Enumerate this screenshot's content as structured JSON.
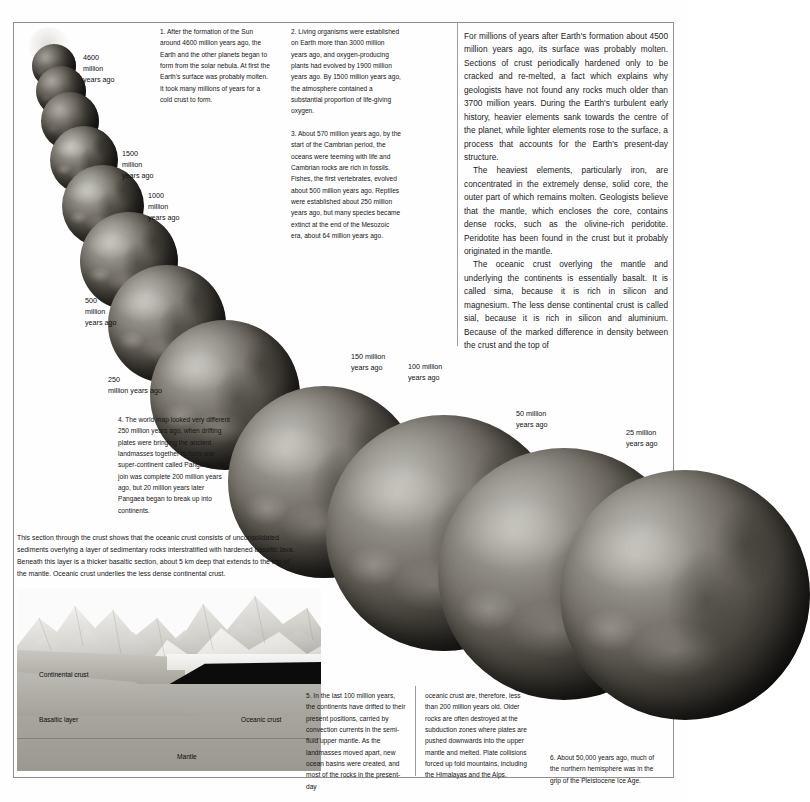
{
  "document": {
    "title": "The formation and structure of the Earth",
    "page_width": 687,
    "page_height": 802
  },
  "article": {
    "paragraphs": [
      "For millions of years after Earth's formation about 4500 million years ago, its surface was probably molten. Sections of crust periodically hardened only to be cracked and re-melted, a fact which explains why geologists have not found any rocks much older than 3700 million years. During the Earth's turbulent early history, heavier elements sank towards the centre of the planet, while lighter elements rose to the surface, a process that accounts for the Earth's present-day structure.",
      "The heaviest elements, particularly iron, are concentrated in the extremely dense, solid core, the outer part of which remains molten. Geologists believe that the mantle, which encloses the core, contains dense rocks, such as the olivine-rich peridotite. Peridotite has been found in the crust but it probably originated in the mantle.",
      "The oceanic crust overlying the mantle and underlying the continents is essentially basalt. It is called sima, because it is rich in silicon and magnesium. The less dense continental crust is called sial, because it is rich in silicon and aluminium. Because of the marked difference in density between the crust and the top of"
    ],
    "italic_terms": [
      "sima",
      "sial"
    ]
  },
  "notes": [
    {
      "number": "1.",
      "text": "After the formation of the Sun around 4600 million years ago, the Earth and the other planets began to form from the solar nebula. At first the Earth's surface was probably molten. It took many millions of years for a cold crust to form."
    },
    {
      "number": "2.",
      "text": "Living organisms were established on Earth more than 3000 million years ago, and oxygen-producing plants had evolved by 1900 million years ago. By 1500 million years ago, the atmosphere contained a substantial proportion of life-giving oxygen."
    },
    {
      "number": "3.",
      "text": "About 570 million years ago, by the start of the Cambrian period, the oceans were teeming with life and Cambrian rocks are rich in fossils. Fishes, the first vertebrates, evolved about 500 million years ago. Reptiles were established about 250 million years ago, but many species became extinct at the end of the Mesozoic era, about 64 million years ago."
    },
    {
      "number": "4.",
      "text": "The world map looked very different 250 million years ago, when drifting plates were bringing the ancient landmasses together to form one super-continent called Pangaea. The join was complete 200 million years ago, but 20 million years later Pangaea began to break up into continents."
    },
    {
      "number": "5.",
      "text": "In the last 100 million years, the continents have drifted to their present positions, carried by convection currents in the semi-fluid upper mantle. As the landmasses moved apart, new ocean basins were created, and most of the rocks in the present-day"
    },
    {
      "number": "5cont",
      "text": "oceanic crust are, therefore, less than 200 million years old. Older rocks are often destroyed at the subduction zones where plates are pushed downwards into the upper mantle and melted. Plate collisions forced up fold mountains, including the Himalayas and the Alps."
    },
    {
      "number": "6.",
      "text": "About 50,000 years ago, much of the northern hemisphere was in the grip of the Pleistocene Ice Age."
    }
  ],
  "crust_caption": "This section through the crust shows that the oceanic crust consists of unconsolidated sediments overlying a layer of sedimentary rocks interstratified with hardened basaltic lava. Beneath this layer is a thicker basaltic section, about 5 km deep that extends to the top of the mantle. Oceanic crust underlies the less dense continental crust.",
  "timeline_labels": [
    {
      "id": "t4600",
      "line1": "4600",
      "line2": "million",
      "line3": "years ago"
    },
    {
      "id": "t1500",
      "line1": "1500",
      "line2": "million",
      "line3": "years ago"
    },
    {
      "id": "t1000",
      "line1": "1000",
      "line2": "million",
      "line3": "years ago"
    },
    {
      "id": "t500",
      "line1": "500",
      "line2": "million",
      "line3": "years ago"
    },
    {
      "id": "t250",
      "line1": "250",
      "line2": "million years ago",
      "line3": ""
    },
    {
      "id": "t150",
      "line1": "150 million",
      "line2": "years ago",
      "line3": ""
    },
    {
      "id": "t100",
      "line1": "100 million",
      "line2": "years ago",
      "line3": ""
    },
    {
      "id": "t50",
      "line1": "50 million",
      "line2": "years ago",
      "line3": ""
    },
    {
      "id": "t25",
      "line1": "25 million",
      "line2": "years ago",
      "line3": ""
    }
  ],
  "section_labels": {
    "continental_crust": "Continental crust",
    "basaltic_layer": "Basaltic layer",
    "oceanic_crust": "Oceanic crust",
    "mantle": "Mantle"
  },
  "colors": {
    "frame_border": "#8e8e8e",
    "divider": "#9a9a9a",
    "text": "#161616",
    "page_background": "#ffffff",
    "crust_dark": "#0c0c0c",
    "mantle_grey": "#a8a59e"
  }
}
